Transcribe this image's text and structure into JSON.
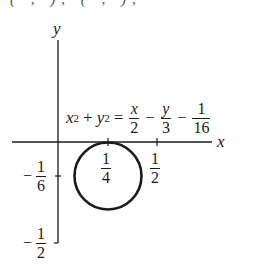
{
  "header": {
    "clipped_text": "( ,  ),  ( , ),  "
  },
  "diagram": {
    "axes": {
      "x_label": "x",
      "y_label": "y"
    },
    "equation": {
      "lhs_x": "x",
      "lhs_x_exp": "2",
      "plus": "+",
      "lhs_y": "y",
      "lhs_y_exp": "2",
      "equals": "=",
      "t1_num": "x",
      "t1_den": "2",
      "minus1": "−",
      "t2_num": "y",
      "t2_den": "3",
      "minus2": "−",
      "t3_num": "1",
      "t3_den": "16"
    },
    "x_ticks": [
      {
        "num": "1",
        "den": "4",
        "value": 0.25
      },
      {
        "num": "1",
        "den": "2",
        "value": 0.5
      }
    ],
    "y_ticks": [
      {
        "sign": "−",
        "num": "1",
        "den": "6",
        "value": -0.1667
      },
      {
        "sign": "−",
        "num": "1",
        "den": "2",
        "value": -0.5
      }
    ],
    "circle": {
      "center": [
        0.25,
        -0.1667
      ],
      "radius": 0.1667,
      "stroke": "#1a1a1a"
    }
  }
}
